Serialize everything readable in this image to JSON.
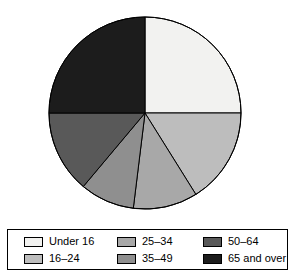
{
  "chart_data": {
    "type": "pie",
    "title": "",
    "subtitle": "",
    "xlabel": "",
    "ylabel": "",
    "grid": false,
    "legend_position": "bottom",
    "start_angle_deg": 0,
    "direction": "clockwise",
    "center": {
      "cx": 145,
      "cy": 113
    },
    "radius": 96,
    "categories": [
      "Under 16",
      "16–24",
      "25–34",
      "35–49",
      "50–64",
      "65 and over"
    ],
    "values": [
      25,
      16,
      11,
      9,
      14,
      25
    ],
    "units": "percent",
    "slices": [
      {
        "label": "Under 16",
        "value": 25,
        "start_deg": 0,
        "end_deg": 90,
        "color": "#f2f2f0"
      },
      {
        "label": "16–24",
        "value": 16,
        "start_deg": 90,
        "end_deg": 148,
        "color": "#bdbdbd"
      },
      {
        "label": "25–34",
        "value": 11,
        "start_deg": 148,
        "end_deg": 187,
        "color": "#a8a8a8"
      },
      {
        "label": "35–49",
        "value": 9,
        "start_deg": 187,
        "end_deg": 220,
        "color": "#8f8f8f"
      },
      {
        "label": "50–64",
        "value": 14,
        "start_deg": 220,
        "end_deg": 270,
        "color": "#595959"
      },
      {
        "label": "65 and over",
        "value": 25,
        "start_deg": 270,
        "end_deg": 360,
        "color": "#1c1c1c"
      }
    ],
    "outline_color": "#000000"
  },
  "legend": {
    "entries": [
      {
        "label": "Under 16",
        "color": "#f2f2f0"
      },
      {
        "label": "16–24",
        "color": "#bdbdbd"
      },
      {
        "label": "25–34",
        "color": "#a8a8a8"
      },
      {
        "label": "35–49",
        "color": "#8f8f8f"
      },
      {
        "label": "50–64",
        "color": "#595959"
      },
      {
        "label": "65 and over",
        "color": "#1c1c1c"
      }
    ],
    "order": [
      0,
      1,
      2,
      3,
      4,
      5
    ],
    "column_order": [
      0,
      2,
      4,
      1,
      3,
      5
    ]
  }
}
